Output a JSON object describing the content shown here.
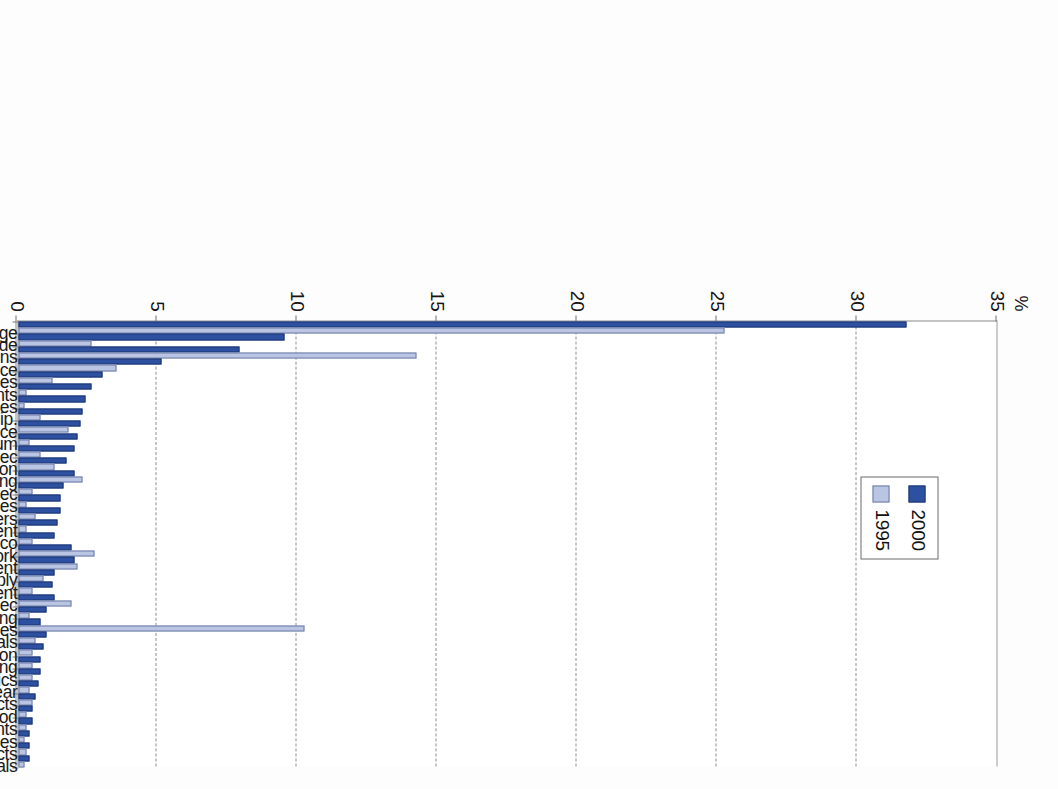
{
  "figure": {
    "orientation": "rotated-90-clockwise",
    "axis_unit": "%",
    "legend": {
      "entries": [
        {
          "label": "1995",
          "color": "#b9c5e2"
        },
        {
          "label": "2000",
          "color": "#2d50a0"
        }
      ]
    }
  },
  "chart_data": {
    "type": "bar",
    "title": "",
    "subtitle": "",
    "xlabel": "",
    "ylabel": "%",
    "ylim": [
      0,
      35
    ],
    "yticks": [
      0,
      5,
      10,
      15,
      20,
      25,
      30,
      35
    ],
    "grid": true,
    "grid_axis": "y",
    "legend_position": "inside-upper-center",
    "orientation": "vertical",
    "categories": [
      "Transport and storage",
      "Wholesale and retail trade",
      "Post and telecommunications",
      "Finance, insurance",
      "Other business activities",
      "Scientific instruments",
      "Computer and related activities",
      "Radio, TV, communication equip.",
      "Public administration and defence",
      "Coke, refined petroleum",
      "Electrical machinery nec",
      "Education",
      "Agriculture, forestry and fishing",
      "Machinery and equipment nec",
      "Real estate activities",
      "Office machinery and computers",
      "Other transport equipment",
      "Food, beverages and tobacco",
      "Health and social work",
      "Research and development",
      "Electricity, gas and water supply",
      "Renting of machinery and equipment",
      "Manufacturing nec",
      "Mining and quarrying",
      "Community, social, personal services",
      "Chemicals",
      "Construction",
      "Paper, printing and publishing",
      "Rubber and plastics",
      "Textiles, leather and footwear",
      "Non-metallic mineral products",
      "Wood",
      "Hotels and restaurants",
      "Motor vehicles",
      "Fabricated metal products",
      "Basic metals"
    ],
    "series": [
      {
        "name": "2000",
        "color": "#2d50a0",
        "values": [
          31.7,
          9.5,
          7.9,
          5.1,
          3.0,
          2.6,
          2.4,
          2.3,
          2.2,
          2.1,
          2.0,
          1.7,
          2.0,
          1.6,
          1.5,
          1.5,
          1.4,
          1.3,
          1.9,
          2.0,
          1.3,
          1.2,
          1.3,
          1.0,
          0.8,
          1.0,
          0.9,
          0.8,
          0.8,
          0.7,
          0.6,
          0.5,
          0.5,
          0.4,
          0.4,
          0.4
        ]
      },
      {
        "name": "1995",
        "color": "#b9c5e2",
        "values": [
          25.2,
          2.6,
          14.2,
          3.5,
          1.2,
          0.3,
          0.2,
          0.8,
          1.8,
          0.4,
          0.8,
          1.3,
          2.3,
          0.5,
          0.3,
          0.6,
          0.3,
          0.5,
          2.7,
          2.1,
          0.9,
          0.5,
          1.9,
          0.4,
          10.2,
          0.6,
          0.5,
          0.5,
          0.5,
          0.4,
          0.5,
          0.3,
          0.3,
          0.2,
          0.3,
          0.2
        ]
      }
    ]
  }
}
